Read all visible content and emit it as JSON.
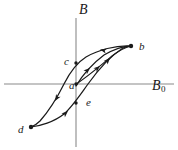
{
  "figure": {
    "kind": "hysteresis-loop-diagram",
    "background_color": "#ffffff",
    "ink_color": "#1a1a1a",
    "axis_color": "#808080"
  },
  "axes": {
    "vertical": {
      "label": "B",
      "x_px": 76,
      "y_top_px": 18,
      "y_bottom_px": 147
    },
    "horizontal": {
      "label": "B",
      "subscript": "0",
      "y_px": 84,
      "x_left_px": 4,
      "x_right_px": 174
    }
  },
  "points": [
    {
      "id": "a",
      "label": "a",
      "x_px": 76,
      "y_px": 84,
      "note": "origin / virgin state"
    },
    {
      "id": "b",
      "label": "b",
      "x_px": 131,
      "y_px": 46,
      "note": "upper saturation",
      "marker": "dot"
    },
    {
      "id": "c",
      "label": "c",
      "x_px": 76,
      "y_px": 63,
      "note": "positive remanence on B axis"
    },
    {
      "id": "d",
      "label": "d",
      "x_px": 31,
      "y_px": 127,
      "note": "lower saturation",
      "marker": "dot"
    },
    {
      "id": "e",
      "label": "e",
      "x_px": 76,
      "y_px": 103,
      "note": "negative remanence on B axis"
    }
  ],
  "curves": [
    {
      "id": "initial-magnetization",
      "name": "initial-magnetization-curve",
      "from": "a",
      "to": "b",
      "path": "M 76 84 C 86 78 100 66 112 56 C 120 50 126 47 131 46",
      "arrows": [
        {
          "x_px": 98,
          "y_px": 68,
          "angle_deg": -38
        }
      ]
    },
    {
      "id": "descending-branch",
      "name": "descending-branch-b-to-c-to-d",
      "from": "b",
      "via": "c",
      "to": "d",
      "path": "M 131 46 C 116 45 98 50 86 57 C 78 62 70 72 64 84 C 58 96 48 112 40 121 C 36 125 33 126 31 127",
      "arrows": [
        {
          "x_px": 102,
          "y_px": 49,
          "angle_deg": 195
        },
        {
          "x_px": 56,
          "y_px": 100,
          "angle_deg": 122
        }
      ]
    },
    {
      "id": "ascending-branch",
      "name": "ascending-branch-d-to-e-to-b",
      "from": "d",
      "via": "e",
      "to": "b",
      "path": "M 31 127 C 40 126 54 122 64 114 C 72 107 80 95 88 84 C 98 70 112 55 123 48 C 127 46 130 46 131 46",
      "arrows": [
        {
          "x_px": 67,
          "y_px": 112,
          "angle_deg": -40
        },
        {
          "x_px": 108,
          "y_px": 60,
          "angle_deg": -48
        }
      ]
    },
    {
      "id": "inner-return",
      "name": "inner-return-branch-a-to-b",
      "from": "a",
      "to": "b",
      "path": "M 76 86 C 82 76 92 64 104 55 C 114 49 125 46 131 46",
      "arrows": [
        {
          "x_px": 92,
          "y_px": 66,
          "angle_deg": -45
        }
      ]
    }
  ]
}
